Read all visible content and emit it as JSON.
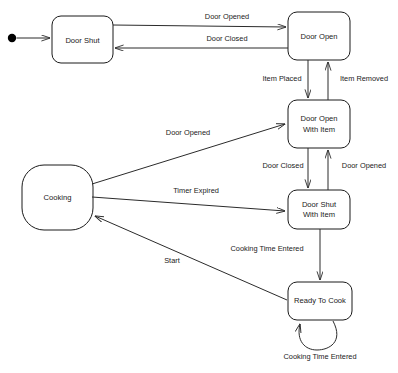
{
  "diagram": {
    "type": "state-machine-diagram",
    "background_color": "#ffffff",
    "line_color": "#2b2b2b",
    "text_color": "#1a1a1a",
    "start_marker": "filled-circle",
    "states": [
      {
        "id": "door_shut",
        "label": "Door Shut",
        "label_line1": "Door Shut",
        "label_line2": "",
        "x": 52,
        "y": 16,
        "w": 61,
        "h": 47,
        "r": 9
      },
      {
        "id": "door_open",
        "label": "Door Open",
        "label_line1": "Door Open",
        "label_line2": "",
        "x": 288,
        "y": 12,
        "w": 62,
        "h": 48,
        "r": 9
      },
      {
        "id": "door_open_with_item",
        "label": "Door Open With Item",
        "label_line1": "Door Open",
        "label_line2": "With Item",
        "x": 288,
        "y": 100,
        "w": 62,
        "h": 48,
        "r": 9
      },
      {
        "id": "door_shut_with_item",
        "label": "Door Shut With Item",
        "label_line1": "Door Shut",
        "label_line2": "With Item",
        "x": 288,
        "y": 190,
        "w": 62,
        "h": 39,
        "r": 9
      },
      {
        "id": "ready_to_cook",
        "label": "Ready To Cook",
        "label_line1": "Ready To Cook",
        "label_line2": "",
        "x": 288,
        "y": 282,
        "w": 64,
        "h": 38,
        "r": 9
      },
      {
        "id": "cooking",
        "label": "Cooking",
        "label_line1": "Cooking",
        "label_line2": "",
        "x": 22,
        "y": 165,
        "w": 71,
        "h": 65,
        "r": 22
      }
    ],
    "transitions": [
      {
        "id": "t_door_opened_top",
        "from": "door_shut",
        "to": "door_open",
        "label": "Door Opened",
        "label_x": 227,
        "label_y": 17
      },
      {
        "id": "t_door_closed_top",
        "from": "door_open",
        "to": "door_shut",
        "label": "Door Closed",
        "label_x": 227,
        "label_y": 39
      },
      {
        "id": "t_item_placed",
        "from": "door_open",
        "to": "door_open_with_item",
        "label": "Item Placed",
        "label_x": 282,
        "label_y": 79
      },
      {
        "id": "t_item_removed",
        "from": "door_open_with_item",
        "to": "door_open",
        "label": "Item Removed",
        "label_x": 364,
        "label_y": 79
      },
      {
        "id": "t_door_closed_mid",
        "from": "door_open_with_item",
        "to": "door_shut_with_item",
        "label": "Door Closed",
        "label_x": 283,
        "label_y": 166
      },
      {
        "id": "t_door_opened_mid",
        "from": "door_shut_with_item",
        "to": "door_open_with_item",
        "label": "Door Opened",
        "label_x": 364,
        "label_y": 166
      },
      {
        "id": "t_door_opened_cooking",
        "from": "cooking",
        "to": "door_open_with_item",
        "label": "Door Opened",
        "label_x": 188,
        "label_y": 133
      },
      {
        "id": "t_timer_expired",
        "from": "cooking",
        "to": "door_shut_with_item",
        "label": "Timer Expired",
        "label_x": 196,
        "label_y": 191
      },
      {
        "id": "t_cooking_time_entered",
        "from": "door_shut_with_item",
        "to": "ready_to_cook",
        "label": "Cooking Time Entered",
        "label_x": 267,
        "label_y": 249
      },
      {
        "id": "t_start",
        "from": "ready_to_cook",
        "to": "cooking",
        "label": "Start",
        "label_x": 172,
        "label_y": 261
      },
      {
        "id": "t_self_cooking_time",
        "from": "ready_to_cook",
        "to": "ready_to_cook",
        "label": "Cooking Time Entered",
        "label_x": 320,
        "label_y": 357
      }
    ],
    "start_transition": {
      "id": "t_initial",
      "to": "door_shut",
      "dot_x": 12,
      "dot_y": 38,
      "dot_r": 4.2
    }
  }
}
